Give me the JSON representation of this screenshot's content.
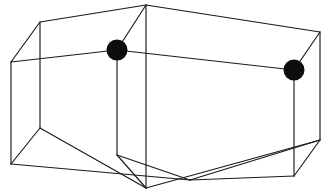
{
  "figure": {
    "background_color": "#ffffff",
    "line_color": "#1a1a1a",
    "dot_color": "#0d0d0d",
    "line_width": 1.15,
    "canvas": {
      "width": 332,
      "height": 193
    }
  },
  "chart_data": {
    "type": "scatter",
    "xlabel": "",
    "ylabel": "",
    "xlim": [
      0,
      332
    ],
    "ylim": [
      0,
      193
    ],
    "grid": false,
    "legend": "none",
    "projection": "oblique-3d",
    "lattice": {
      "nx": 2,
      "ny": 1,
      "nz": 1,
      "note": "Box split into two cells along its long axis"
    },
    "vertices": [
      {
        "id": "top-back-left",
        "x": 40,
        "y": 22
      },
      {
        "id": "top-back-mid",
        "x": 146,
        "y": 5
      },
      {
        "id": "top-back-right",
        "x": 320,
        "y": 32
      },
      {
        "id": "top-front-left",
        "x": 11,
        "y": 62
      },
      {
        "id": "top-front-mid",
        "x": 117,
        "y": 50
      },
      {
        "id": "top-front-right",
        "x": 294,
        "y": 70
      },
      {
        "id": "bot-back-left",
        "x": 40,
        "y": 128
      },
      {
        "id": "bot-back-mid",
        "x": 146,
        "y": 188
      },
      {
        "id": "bot-back-right",
        "x": 320,
        "y": 140
      },
      {
        "id": "bot-front-left",
        "x": 11,
        "y": 164
      },
      {
        "id": "bot-front-mid",
        "x": 117,
        "y": 155
      },
      {
        "id": "bot-front-right",
        "x": 294,
        "y": 176
      },
      {
        "id": "mid-front-low",
        "x": 190,
        "y": 180
      }
    ],
    "edges": [
      {
        "from": "top-front-left",
        "to": "top-back-left",
        "kind": "depth"
      },
      {
        "from": "top-back-left",
        "to": "top-back-mid",
        "kind": "back-top"
      },
      {
        "from": "top-back-mid",
        "to": "top-back-right",
        "kind": "back-top"
      },
      {
        "from": "top-back-right",
        "to": "top-front-right",
        "kind": "depth"
      },
      {
        "from": "top-front-right",
        "to": "top-front-mid",
        "kind": "front-top"
      },
      {
        "from": "top-front-mid",
        "to": "top-front-left",
        "kind": "front-top"
      },
      {
        "from": "top-front-mid",
        "to": "top-back-mid",
        "kind": "depth-divider"
      },
      {
        "from": "top-front-left",
        "to": "bot-front-left",
        "kind": "vertical"
      },
      {
        "from": "top-front-mid",
        "to": "bot-front-mid",
        "kind": "vertical"
      },
      {
        "from": "top-front-right",
        "to": "bot-front-right",
        "kind": "vertical"
      },
      {
        "from": "top-back-left",
        "to": "bot-back-left",
        "kind": "vertical"
      },
      {
        "from": "top-back-mid",
        "to": "bot-back-mid",
        "kind": "vertical"
      },
      {
        "from": "top-back-right",
        "to": "bot-back-right",
        "kind": "vertical"
      },
      {
        "from": "bot-front-left",
        "to": "bot-back-left",
        "kind": "depth"
      },
      {
        "from": "bot-back-left",
        "to": "bot-back-mid",
        "kind": "back-bottom"
      },
      {
        "from": "bot-back-mid",
        "to": "bot-back-right",
        "kind": "back-bottom"
      },
      {
        "from": "bot-back-right",
        "to": "bot-front-right",
        "kind": "depth"
      },
      {
        "from": "bot-front-right",
        "to": "mid-front-low",
        "kind": "front-bottom"
      },
      {
        "from": "mid-front-low",
        "to": "bot-front-left",
        "kind": "front-bottom"
      },
      {
        "from": "bot-front-mid",
        "to": "bot-back-mid",
        "kind": "depth-divider"
      },
      {
        "from": "bot-front-mid",
        "to": "mid-front-low",
        "kind": "front-bottom-aux"
      },
      {
        "from": "mid-front-low",
        "to": "bot-back-right",
        "kind": "front-bottom-aux"
      }
    ],
    "points": [
      {
        "id": "dot-left",
        "label": "",
        "x": 117,
        "y": 50,
        "r": 10.5,
        "vertex": "top-front-mid"
      },
      {
        "id": "dot-right",
        "label": "",
        "x": 294,
        "y": 70,
        "r": 10.5,
        "vertex": "top-front-right"
      }
    ],
    "point_count": 2
  }
}
